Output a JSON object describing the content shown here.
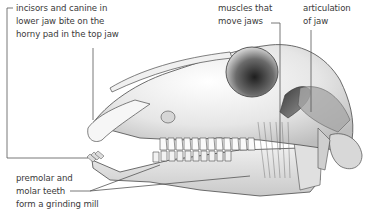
{
  "diagram": {
    "labels": {
      "incisors": {
        "lines": [
          "incisors and canine in",
          "lower jaw bite on the",
          "horny pad in the top jaw"
        ]
      },
      "muscles": {
        "lines": [
          "muscles that",
          "move jaws"
        ]
      },
      "articulation": {
        "lines": [
          "articulation",
          "of jaw"
        ]
      },
      "molars": {
        "lines": [
          "premolar and",
          "molar teeth",
          "form a grinding mill"
        ]
      }
    },
    "colors": {
      "background": "#ffffff",
      "label_text": "#3a3a3a",
      "leader_line": "#555555",
      "bone_light": "#f2f2f2",
      "bone_mid": "#d4d4d4",
      "bone_dark": "#8a8a8a",
      "outline": "#4a4a4a"
    }
  }
}
